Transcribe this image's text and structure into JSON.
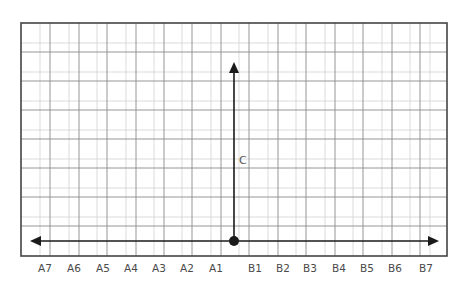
{
  "diagram": {
    "type": "number-line-grid",
    "horizontal_axis": {
      "direction": "bidirectional",
      "left_labels": [
        "A7",
        "A6",
        "A5",
        "A4",
        "A3",
        "A2",
        "A1"
      ],
      "right_labels": [
        "B1",
        "B2",
        "B3",
        "B4",
        "B5",
        "B6",
        "B7"
      ]
    },
    "vertical_axis": {
      "direction": "up",
      "label": "C"
    },
    "origin_marker": "filled-circle",
    "colors": {
      "axis": "#1a1a1a",
      "grid_major": "#8a8a8a",
      "grid_minor": "#d2d2d2",
      "frame": "#444444",
      "label": "#4a4a4a"
    }
  }
}
